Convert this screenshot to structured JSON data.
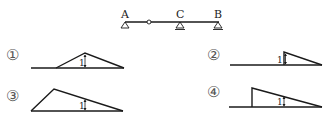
{
  "beam": {
    "supports": [
      {
        "label": "A",
        "type": "pin"
      },
      {
        "label": "C",
        "type": "pin"
      },
      {
        "label": "B",
        "type": "roller"
      }
    ],
    "hinge": "internal hinge between A and C"
  },
  "options": [
    {
      "marker": "①",
      "ordinate": "1",
      "shape": "triangle rising from hinge region, peak at C, zero at B"
    },
    {
      "marker": "②",
      "ordinate": "1",
      "shape": "zero to C, jump to 1 at C, decreasing to zero at B"
    },
    {
      "marker": "③",
      "ordinate": "1",
      "shape": "triangle rising from A to peak then decreasing to B"
    },
    {
      "marker": "④",
      "ordinate": "1",
      "shape": "zero to hinge, jump at hinge, decreasing to zero at B"
    }
  ],
  "colors": {
    "line": "#1a1a1a",
    "marker": "#555555"
  }
}
